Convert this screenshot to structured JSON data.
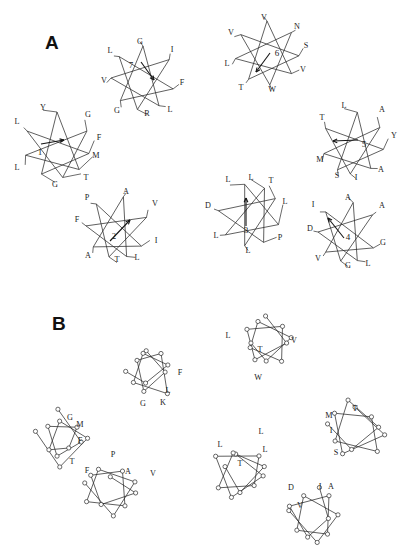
{
  "figure": {
    "background": "#ffffff",
    "ink_color": "#2b2b2b",
    "width": 406,
    "height": 556
  },
  "panels": [
    {
      "id": "A",
      "label": "A",
      "x": 45,
      "y": 32
    },
    {
      "id": "B",
      "label": "B",
      "x": 52,
      "y": 313
    }
  ],
  "chart_data": {
    "type": "scatter",
    "title": "",
    "xlabel": "",
    "ylabel": "",
    "panel_a_wheels": [
      {
        "number": "1",
        "cx": 57,
        "cy": 145,
        "r": 33,
        "arrow": {
          "x1": 41,
          "y1": 144,
          "x2": 64,
          "y2": 140
        },
        "number_pos": {
          "x": 40,
          "y": 155
        },
        "residues": [
          {
            "label": "Y",
            "angle": -90,
            "lx": 43,
            "ly": 110
          },
          {
            "label": "G",
            "angle": -25,
            "lx": 88,
            "ly": 117
          },
          {
            "label": "F",
            "angle": 15,
            "lx": 99,
            "ly": 140
          },
          {
            "label": "M",
            "angle": 48,
            "lx": 96,
            "ly": 158
          },
          {
            "label": "T",
            "angle": 80,
            "lx": 86,
            "ly": 180
          },
          {
            "label": "G",
            "angle": 118,
            "lx": 55,
            "ly": 187
          },
          {
            "label": "L",
            "angle": 162,
            "lx": 17,
            "ly": 170
          },
          {
            "label": "L",
            "angle": 205,
            "lx": 17,
            "ly": 124
          }
        ]
      },
      {
        "number": "7",
        "cx": 143,
        "cy": 78,
        "r": 32,
        "arrow": {
          "x1": 141,
          "y1": 62,
          "x2": 154,
          "y2": 80
        },
        "number_pos": {
          "x": 131,
          "y": 68
        },
        "residues": [
          {
            "label": "G",
            "angle": -90,
            "lx": 140,
            "ly": 44
          },
          {
            "label": "I",
            "angle": -35,
            "lx": 172,
            "ly": 52
          },
          {
            "label": "F",
            "angle": 20,
            "lx": 182,
            "ly": 85
          },
          {
            "label": "L",
            "angle": 60,
            "lx": 170,
            "ly": 112
          },
          {
            "label": "R",
            "angle": 100,
            "lx": 147,
            "ly": 116
          },
          {
            "label": "G",
            "angle": 135,
            "lx": 117,
            "ly": 113
          },
          {
            "label": "V",
            "angle": 180,
            "lx": 104,
            "ly": 83
          },
          {
            "label": "L",
            "angle": 222,
            "lx": 110,
            "ly": 53
          }
        ]
      },
      {
        "number": "6",
        "cx": 267,
        "cy": 53,
        "r": 32,
        "arrow": {
          "x1": 270,
          "y1": 53,
          "x2": 256,
          "y2": 72
        },
        "number_pos": {
          "x": 277,
          "y": 56
        },
        "residues": [
          {
            "label": "V",
            "angle": -90,
            "lx": 264,
            "ly": 20
          },
          {
            "label": "N",
            "angle": -40,
            "lx": 297,
            "ly": 29
          },
          {
            "label": "S",
            "angle": 5,
            "lx": 306,
            "ly": 48
          },
          {
            "label": "V",
            "angle": 40,
            "lx": 303,
            "ly": 72
          },
          {
            "label": "W",
            "angle": 85,
            "lx": 272,
            "ly": 92
          },
          {
            "label": "T",
            "angle": 125,
            "lx": 241,
            "ly": 90
          },
          {
            "label": "L",
            "angle": 170,
            "lx": 227,
            "ly": 66
          },
          {
            "label": "V",
            "angle": 215,
            "lx": 231,
            "ly": 35
          }
        ]
      },
      {
        "number": "5",
        "cx": 353,
        "cy": 143,
        "r": 31,
        "arrow": {
          "x1": 358,
          "y1": 140,
          "x2": 333,
          "y2": 141
        },
        "number_pos": {
          "x": 364,
          "y": 147
        },
        "residues": [
          {
            "label": "L",
            "angle": -82,
            "lx": 344,
            "ly": 108
          },
          {
            "label": "A",
            "angle": -30,
            "lx": 382,
            "ly": 112
          },
          {
            "label": "Y",
            "angle": 12,
            "lx": 394,
            "ly": 138
          },
          {
            "label": "A",
            "angle": 55,
            "lx": 381,
            "ly": 172
          },
          {
            "label": "I",
            "angle": 95,
            "lx": 356,
            "ly": 180
          },
          {
            "label": "S",
            "angle": 120,
            "lx": 337,
            "ly": 178
          },
          {
            "label": "M",
            "angle": 160,
            "lx": 320,
            "ly": 162
          },
          {
            "label": "T",
            "angle": 208,
            "lx": 322,
            "ly": 120
          }
        ]
      },
      {
        "number": "2",
        "cx": 117,
        "cy": 227,
        "r": 31,
        "arrow": {
          "x1": 110,
          "y1": 241,
          "x2": 130,
          "y2": 220
        },
        "number_pos": {
          "x": 114,
          "y": 239
        },
        "residues": [
          {
            "label": "A",
            "angle": -78,
            "lx": 126,
            "ly": 194
          },
          {
            "label": "V",
            "angle": -18,
            "lx": 155,
            "ly": 206
          },
          {
            "label": "I",
            "angle": 38,
            "lx": 156,
            "ly": 243
          },
          {
            "label": "L",
            "angle": 72,
            "lx": 137,
            "ly": 260
          },
          {
            "label": "T",
            "angle": 105,
            "lx": 117,
            "ly": 262
          },
          {
            "label": "A",
            "angle": 140,
            "lx": 88,
            "ly": 258
          },
          {
            "label": "F",
            "angle": 182,
            "lx": 77,
            "ly": 222
          },
          {
            "label": "P",
            "angle": 228,
            "lx": 87,
            "ly": 200
          }
        ]
      },
      {
        "number": "3",
        "cx": 249,
        "cy": 215,
        "r": 31,
        "arrow": {
          "x1": 246,
          "y1": 226,
          "x2": 246,
          "y2": 198
        },
        "number_pos": {
          "x": 246,
          "y": 233
        },
        "residues": [
          {
            "label": "L",
            "angle": -98,
            "lx": 228,
            "ly": 182
          },
          {
            "label": "L",
            "angle": -60,
            "lx": 251,
            "ly": 180
          },
          {
            "label": "T",
            "angle": -32,
            "lx": 271,
            "ly": 183
          },
          {
            "label": "L",
            "angle": 18,
            "lx": 285,
            "ly": 204
          },
          {
            "label": "P",
            "angle": 62,
            "lx": 280,
            "ly": 240
          },
          {
            "label": "L",
            "angle": 98,
            "lx": 248,
            "ly": 253
          },
          {
            "label": "L",
            "angle": 140,
            "lx": 216,
            "ly": 238
          },
          {
            "label": "D",
            "angle": 188,
            "lx": 208,
            "ly": 208
          }
        ]
      },
      {
        "number": "4",
        "cx": 348,
        "cy": 232,
        "r": 30,
        "arrow": {
          "x1": 344,
          "y1": 238,
          "x2": 328,
          "y2": 218
        },
        "number_pos": {
          "x": 348,
          "y": 240
        },
        "residues": [
          {
            "label": "A",
            "angle": -80,
            "lx": 348,
            "ly": 200
          },
          {
            "label": "A",
            "angle": -35,
            "lx": 382,
            "ly": 208
          },
          {
            "label": "G",
            "angle": 32,
            "lx": 383,
            "ly": 245
          },
          {
            "label": "L",
            "angle": 72,
            "lx": 368,
            "ly": 266
          },
          {
            "label": "G",
            "angle": 104,
            "lx": 348,
            "ly": 268
          },
          {
            "label": "V",
            "angle": 138,
            "lx": 318,
            "ly": 261
          },
          {
            "label": "D",
            "angle": 180,
            "lx": 310,
            "ly": 231
          },
          {
            "label": "I",
            "angle": 222,
            "lx": 313,
            "ly": 207
          }
        ]
      }
    ],
    "panel_b_projections": [
      {
        "id": "b-top-center",
        "cx": 150,
        "cy": 372,
        "labels": [
          {
            "label": "F",
            "x": 180,
            "y": 375
          },
          {
            "label": "L",
            "x": 168,
            "y": 393
          },
          {
            "label": "K",
            "x": 163,
            "y": 405
          },
          {
            "label": "G",
            "x": 143,
            "y": 406
          }
        ]
      },
      {
        "id": "b-top-right",
        "cx": 265,
        "cy": 342,
        "labels": [
          {
            "label": "L",
            "x": 228,
            "y": 338
          },
          {
            "label": "T",
            "x": 260,
            "y": 352
          },
          {
            "label": "V",
            "x": 294,
            "y": 343
          },
          {
            "label": "W",
            "x": 258,
            "y": 380
          }
        ]
      },
      {
        "id": "b-left",
        "cx": 62,
        "cy": 440,
        "labels": [
          {
            "label": "G",
            "x": 70,
            "y": 420
          },
          {
            "label": "M",
            "x": 80,
            "y": 427
          },
          {
            "label": "F",
            "x": 80,
            "y": 443
          },
          {
            "label": "T",
            "x": 72,
            "y": 464
          }
        ]
      },
      {
        "id": "b-bottom-left",
        "cx": 110,
        "cy": 490,
        "labels": [
          {
            "label": "P",
            "x": 113,
            "y": 457
          },
          {
            "label": "F",
            "x": 87,
            "y": 473
          },
          {
            "label": "A",
            "x": 128,
            "y": 474
          },
          {
            "label": "V",
            "x": 153,
            "y": 476
          }
        ]
      },
      {
        "id": "b-center",
        "cx": 240,
        "cy": 472,
        "labels": [
          {
            "label": "L",
            "x": 261,
            "y": 434
          },
          {
            "label": "L",
            "x": 220,
            "y": 447
          },
          {
            "label": "L",
            "x": 265,
            "y": 452
          },
          {
            "label": "T",
            "x": 240,
            "y": 466
          }
        ]
      },
      {
        "id": "b-right",
        "cx": 355,
        "cy": 430,
        "labels": [
          {
            "label": "M",
            "x": 329,
            "y": 418
          },
          {
            "label": "T",
            "x": 355,
            "y": 411
          },
          {
            "label": "I",
            "x": 331,
            "y": 433
          },
          {
            "label": "S",
            "x": 336,
            "y": 455
          }
        ]
      },
      {
        "id": "b-bottom-right",
        "cx": 315,
        "cy": 515,
        "labels": [
          {
            "label": "D",
            "x": 291,
            "y": 490
          },
          {
            "label": "I",
            "x": 320,
            "y": 489
          },
          {
            "label": "A",
            "x": 331,
            "y": 489
          },
          {
            "label": "V",
            "x": 300,
            "y": 508
          }
        ]
      }
    ]
  }
}
